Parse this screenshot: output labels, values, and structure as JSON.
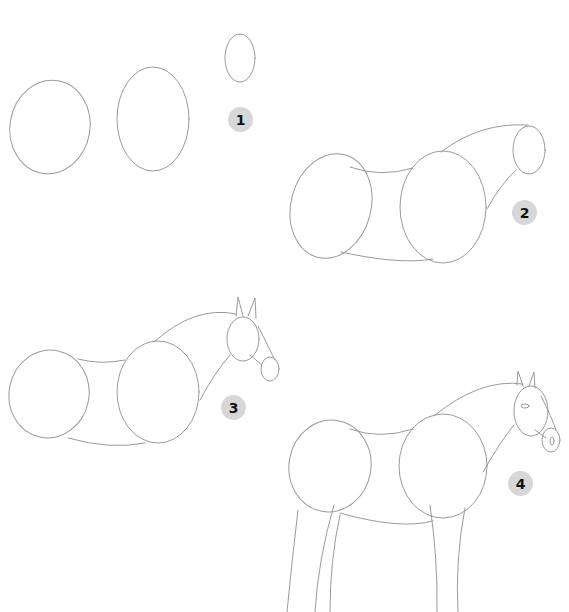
{
  "steps": [
    {
      "number": "1",
      "description": "Three ovals: hindquarters, chest, head"
    },
    {
      "number": "2",
      "description": "Connect ovals for body and neck"
    },
    {
      "number": "3",
      "description": "Add ears and muzzle"
    },
    {
      "number": "4",
      "description": "Add legs, eye and nostril"
    }
  ],
  "colors": {
    "line": "#9a9a9a",
    "badge": "#d7d7d7",
    "badge_text": "#111111"
  }
}
